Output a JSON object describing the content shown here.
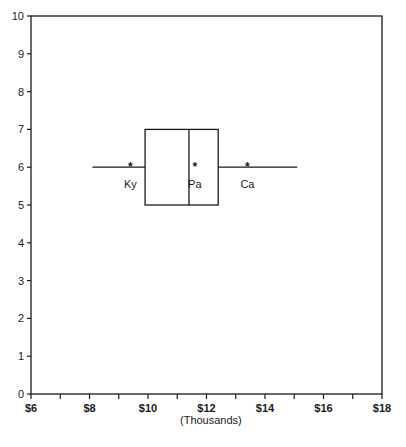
{
  "chart_data": {
    "type": "boxplot",
    "title": "",
    "xlabel": "(Thousands)",
    "ylabel": "",
    "xlim": [
      6,
      18
    ],
    "ylim": [
      0,
      10
    ],
    "grid": false,
    "x_ticks": [
      6,
      7,
      8,
      9,
      10,
      11,
      12,
      13,
      14,
      15,
      16,
      17,
      18
    ],
    "x_tick_labels": [
      {
        "value": 6,
        "label": "$6"
      },
      {
        "value": 8,
        "label": "$8"
      },
      {
        "value": 10,
        "label": "$10"
      },
      {
        "value": 12,
        "label": "$12"
      },
      {
        "value": 14,
        "label": "$14"
      },
      {
        "value": 16,
        "label": "$16"
      },
      {
        "value": 18,
        "label": "$18"
      }
    ],
    "y_ticks": [
      0,
      1,
      2,
      3,
      4,
      5,
      6,
      7,
      8,
      9,
      10
    ],
    "y_tick_labels": [
      "0",
      "1",
      "2",
      "3",
      "4",
      "5",
      "6",
      "7",
      "8",
      "9",
      "10"
    ],
    "box": {
      "orientation": "horizontal",
      "y_center": 6,
      "y_bottom": 5,
      "y_top": 7,
      "whisker_low": 8.1,
      "q1": 9.9,
      "median": 11.4,
      "q3": 12.4,
      "whisker_high": 15.1
    },
    "markers": [
      {
        "label": "Ky",
        "x": 9.4,
        "y": 6,
        "symbol": "*"
      },
      {
        "label": "Pa",
        "x": 11.6,
        "y": 6,
        "symbol": "*"
      },
      {
        "label": "Ca",
        "x": 13.4,
        "y": 6,
        "symbol": "*"
      }
    ],
    "colors": {
      "ink": "#1a1a1a",
      "background": "#ffffff"
    }
  }
}
